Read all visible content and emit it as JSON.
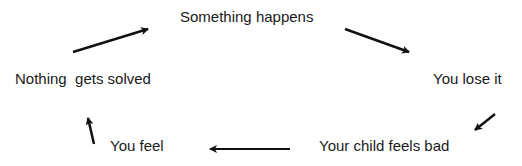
{
  "diagram": {
    "type": "cycle",
    "nodes": [
      {
        "id": "n1",
        "label": "Something happens"
      },
      {
        "id": "n2",
        "label": "You lose it"
      },
      {
        "id": "n3",
        "label": "Your child feels bad"
      },
      {
        "id": "n4",
        "label": "You feel"
      },
      {
        "id": "n5",
        "label": "Nothing  gets solved"
      }
    ],
    "edges": [
      {
        "from": "n1",
        "to": "n2"
      },
      {
        "from": "n2",
        "to": "n3"
      },
      {
        "from": "n3",
        "to": "n4"
      },
      {
        "from": "n4",
        "to": "n5"
      },
      {
        "from": "n5",
        "to": "n1"
      }
    ],
    "colors": {
      "text": "#1a1a1a",
      "arrow": "#111111",
      "background": "#ffffff"
    }
  }
}
